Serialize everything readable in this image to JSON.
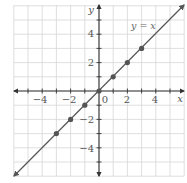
{
  "chart_data": {
    "type": "line",
    "title": "",
    "xlabel": "x",
    "ylabel": "y",
    "xlim": [
      -6,
      6
    ],
    "ylim": [
      -6,
      6
    ],
    "grid": true,
    "x_ticks": [
      -4,
      -2,
      0,
      2,
      4
    ],
    "y_ticks": [
      -4,
      -2,
      2,
      4
    ],
    "x_tick_labels": [
      "−4",
      "−2",
      "0",
      "2",
      "4"
    ],
    "y_tick_labels": [
      "−4",
      "−2",
      "2",
      "4"
    ],
    "origin_label": "0",
    "series": [
      {
        "name": "y = x",
        "equation": "y = x",
        "line": {
          "x": [
            -6,
            6
          ],
          "y": [
            -6,
            6
          ]
        },
        "points": {
          "x": [
            -3,
            -2,
            -1,
            0,
            1,
            2,
            3
          ],
          "y": [
            -3,
            -2,
            -1,
            0,
            1,
            2,
            3
          ]
        }
      }
    ],
    "annotations": [
      {
        "text": "y = x",
        "x": 2.2,
        "y": 4.3
      }
    ],
    "colors": {
      "grid": "#d6d6d6",
      "axis": "#333333",
      "line": "#555555",
      "point": "#555555",
      "text": "#555555"
    }
  },
  "labels": {
    "x_axis": "x",
    "y_axis": "y",
    "series_label": "y = x",
    "origin": "0",
    "xt_m4": "−4",
    "xt_m2": "−2",
    "xt_2": "2",
    "xt_4": "4",
    "yt_4": "4",
    "yt_2": "2",
    "yt_m2": "−2",
    "yt_m4": "−4"
  }
}
